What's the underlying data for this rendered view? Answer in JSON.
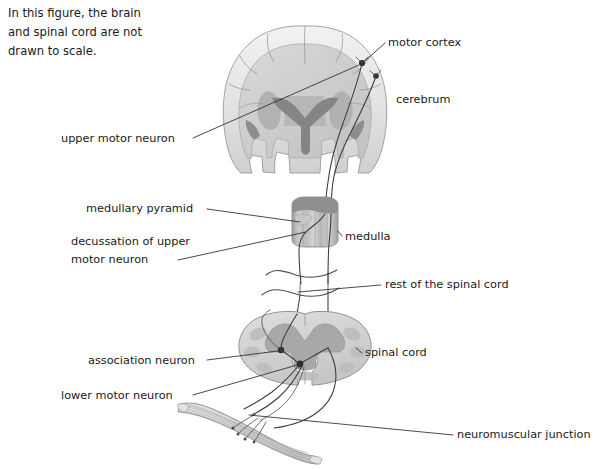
{
  "figure": {
    "background_color": "#ffffff",
    "width": 599,
    "height": 469,
    "note": {
      "lines": [
        "In this figure, the brain",
        "and spinal cord are not",
        "drawn to scale."
      ]
    },
    "palette": {
      "text": "#1a1a1a",
      "leader_line": "#2b2b2b",
      "axon": "#3a3a3a",
      "soma": "#2e2e2e",
      "tissue_outline": "#8d8d8d",
      "cortex_light": "#e8e8e8",
      "white_matter": "#d2d2d2",
      "gray_matter": "#b4b4b4",
      "ventricle": "#8a8a8a",
      "medulla_cap": "#9a9a9a",
      "muscle_fill": "#d6d6d6",
      "muscle_stripe": "#b0b0b0"
    },
    "labels": [
      {
        "id": "motor-cortex",
        "text": "motor cortex",
        "x": 388,
        "y": 46,
        "anchor": "start"
      },
      {
        "id": "cerebrum",
        "text": "cerebrum",
        "x": 396,
        "y": 103,
        "anchor": "start"
      },
      {
        "id": "upper-motor-neuron",
        "text": "upper motor neuron",
        "x": 61,
        "y": 142,
        "anchor": "start"
      },
      {
        "id": "medullary-pyramid",
        "text": "medullary pyramid",
        "x": 86,
        "y": 212,
        "anchor": "start"
      },
      {
        "id": "decussation-1",
        "text": "decussation of upper",
        "x": 71,
        "y": 245,
        "anchor": "start"
      },
      {
        "id": "decussation-2",
        "text": "motor neuron",
        "x": 71,
        "y": 263,
        "anchor": "start"
      },
      {
        "id": "medulla",
        "text": "medulla",
        "x": 345,
        "y": 240,
        "anchor": "start"
      },
      {
        "id": "rest-of-spinal-cord",
        "text": "rest of the spinal cord",
        "x": 385,
        "y": 288,
        "anchor": "start"
      },
      {
        "id": "association-neuron",
        "text": "association neuron",
        "x": 88,
        "y": 364,
        "anchor": "start"
      },
      {
        "id": "lower-motor-neuron",
        "text": "lower motor neuron",
        "x": 61,
        "y": 399,
        "anchor": "start"
      },
      {
        "id": "spinal-cord",
        "text": "spinal cord",
        "x": 365,
        "y": 356,
        "anchor": "start"
      },
      {
        "id": "neuromuscular",
        "text": "neuromuscular junction",
        "x": 457,
        "y": 438,
        "anchor": "start"
      }
    ],
    "structures": [
      {
        "id": "cerebrum-section",
        "name": "cerebrum coronal section"
      },
      {
        "id": "medulla-section",
        "name": "medulla oblongata"
      },
      {
        "id": "spinal-cord-section",
        "name": "spinal cord cross section"
      },
      {
        "id": "skeletal-muscle",
        "name": "skeletal muscle"
      }
    ]
  }
}
